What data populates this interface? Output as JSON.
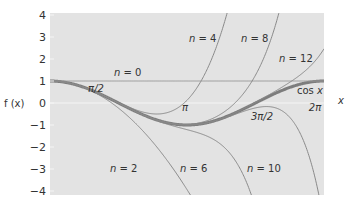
{
  "chart_data": {
    "type": "line",
    "xlabel": "x",
    "ylabel": "f (x)",
    "xlim": [
      0,
      6.2832
    ],
    "ylim": [
      -4,
      4
    ],
    "grid": false,
    "background": "#e3e3e3",
    "y_ticks": [
      4,
      3,
      2,
      1,
      0,
      -1,
      -2,
      -3,
      -4
    ],
    "y_tick_labels": [
      "4",
      "3",
      "2",
      "1",
      "0",
      "−1",
      "−2",
      "−3",
      "−4"
    ],
    "x_tick_labels": [
      {
        "label": "π/2",
        "x": 1.5708
      },
      {
        "label": "π",
        "x": 3.1416
      },
      {
        "label": "3π/2",
        "x": 4.7124
      },
      {
        "label": "2π",
        "x": 6.2832
      }
    ],
    "series": [
      {
        "name": "cos x",
        "function": "cos(x)",
        "style": "thick"
      },
      {
        "name": "n = 0",
        "order": 0
      },
      {
        "name": "n = 2",
        "order": 2
      },
      {
        "name": "n = 4",
        "order": 4
      },
      {
        "name": "n = 6",
        "order": 6
      },
      {
        "name": "n = 8",
        "order": 8
      },
      {
        "name": "n = 10",
        "order": 10
      },
      {
        "name": "n = 12",
        "order": 12
      }
    ],
    "annotations": [
      {
        "text": "n = 0",
        "x": 114,
        "y": 76
      },
      {
        "text": "n = 2",
        "x": 110,
        "y": 172
      },
      {
        "text": "n = 4",
        "x": 189,
        "y": 42
      },
      {
        "text": "n = 6",
        "x": 180,
        "y": 172
      },
      {
        "text": "n = 8",
        "x": 241,
        "y": 42
      },
      {
        "text": "n = 10",
        "x": 247,
        "y": 172
      },
      {
        "text": "n = 12",
        "x": 279,
        "y": 62
      },
      {
        "text": "cos x",
        "x": 297,
        "y": 94
      }
    ],
    "colors": {
      "approx": "#8a8a8a",
      "cos": "#7d7d7d",
      "axis_zero": "#f5f5f5",
      "n0": "#999999"
    }
  }
}
